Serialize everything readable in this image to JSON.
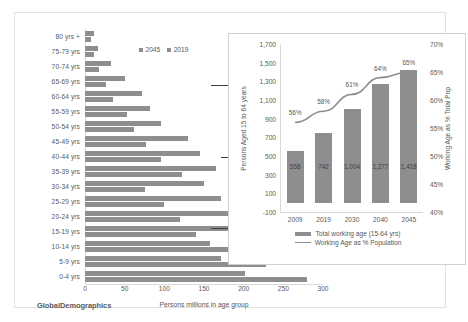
{
  "branding": "GlobalDemographics",
  "colors": {
    "bar": "#8e8e8e",
    "line": "#8e8e8e",
    "text": "#595959",
    "bracket": "#3f3f3f"
  },
  "pyramid": {
    "xlabel": "Persons millions in age group",
    "legend": [
      {
        "label": "2045"
      },
      {
        "label": "2019"
      }
    ],
    "xticks": [
      "0",
      "50",
      "100",
      "150",
      "200",
      "250",
      "300"
    ]
  },
  "inset": {
    "legend": [
      {
        "label": "Total working age (15-64 yrs)"
      },
      {
        "label": "Working Age as % Population"
      }
    ],
    "ylabel_left": "Persons Aged 15 to 64 years",
    "ylabel_right": "Working Age as % Total Pop",
    "yticks_left": [
      "1,700",
      "1,500",
      "1,300",
      "1,100",
      "900",
      "700",
      "500",
      "300",
      "100",
      "-100"
    ],
    "yticks_right": [
      "70%",
      "65%",
      "60%",
      "55%",
      "50%",
      "45%",
      "40%"
    ]
  },
  "chart_data": [
    {
      "type": "bar",
      "orientation": "horizontal",
      "title": "",
      "xlabel": "Persons millions in age group",
      "ylabel": "",
      "xlim": [
        0,
        300
      ],
      "grid": false,
      "legend_position": "top-center",
      "categories": [
        "80 yrs +",
        "75-79 yrs",
        "70-74 yrs",
        "65-69 yrs",
        "60-64 yrs",
        "55-59 yrs",
        "50-54 yrs",
        "45-49 yrs",
        "40-44 yrs",
        "35-39 yrs",
        "30-34 yrs",
        "25-29 yrs",
        "20-24 yrs",
        "15-19 yrs",
        "10-14 yrs",
        "5-9 yrs",
        "0-4 yrs"
      ],
      "series": [
        {
          "name": "2045",
          "values": [
            11,
            17,
            33,
            50,
            72,
            82,
            96,
            130,
            145,
            165,
            150,
            172,
            192,
            208,
            158,
            172,
            202
          ]
        },
        {
          "name": "2019",
          "values": [
            8,
            11,
            18,
            26,
            35,
            53,
            62,
            77,
            96,
            122,
            75,
            100,
            120,
            140,
            225,
            228,
            280
          ]
        }
      ]
    },
    {
      "type": "bar",
      "title": "",
      "xlabel": "",
      "ylabel": "Persons Aged 15 to 64 years",
      "ylabel_secondary": "Working Age as % Total Pop",
      "ylim": [
        -100,
        1700
      ],
      "ylim_secondary": [
        40,
        70
      ],
      "grid": false,
      "legend_position": "bottom-center",
      "categories": [
        "2009",
        "2019",
        "2030",
        "2040",
        "2045"
      ],
      "series": [
        {
          "name": "Total working age (15-64 yrs)",
          "type": "bar",
          "values": [
            558,
            742,
            1004,
            1277,
            1418
          ],
          "labels": [
            "558",
            "742",
            "1,004",
            "1,277",
            "1,418"
          ]
        },
        {
          "name": "Working Age as % Population",
          "type": "line",
          "axis": "secondary",
          "values": [
            56,
            58,
            61,
            64,
            65
          ],
          "labels": [
            "56%",
            "58%",
            "61%",
            "64%",
            "65%"
          ]
        }
      ]
    }
  ]
}
